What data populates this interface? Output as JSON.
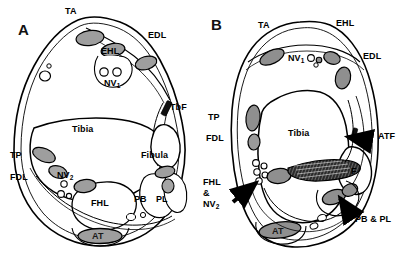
{
  "figure": {
    "type": "anatomical-cross-section-diagram",
    "panels": [
      {
        "id": "A",
        "letter": "A",
        "level": "distal tibia",
        "labels": [
          {
            "key": "ta",
            "text": "TA",
            "meaning": "tibialis anterior"
          },
          {
            "key": "ehl",
            "text": "EHL",
            "meaning": "extensor hallucis longus"
          },
          {
            "key": "edl",
            "text": "EDL",
            "meaning": "extensor digitorum longus"
          },
          {
            "key": "nv1",
            "text": "NV",
            "sub": "1",
            "meaning": "anterior neurovascular bundle"
          },
          {
            "key": "tbf",
            "text": "TbF",
            "meaning": "tibiofibular ligament"
          },
          {
            "key": "tibia",
            "text": "Tibia",
            "meaning": "tibia"
          },
          {
            "key": "fibula",
            "text": "Fibula",
            "meaning": "fibula"
          },
          {
            "key": "tp",
            "text": "TP",
            "meaning": "tibialis posterior"
          },
          {
            "key": "fdl",
            "text": "FDL",
            "meaning": "flexor digitorum longus"
          },
          {
            "key": "nv2",
            "text": "NV",
            "sub": "2",
            "meaning": "posterior neurovascular bundle"
          },
          {
            "key": "fhl",
            "text": "FHL",
            "meaning": "flexor hallucis longus"
          },
          {
            "key": "pb",
            "text": "PB",
            "meaning": "peroneus brevis"
          },
          {
            "key": "pl",
            "text": "PL",
            "meaning": "peroneus longus"
          },
          {
            "key": "at",
            "text": "AT",
            "meaning": "Achilles tendon"
          }
        ]
      },
      {
        "id": "B",
        "letter": "B",
        "level": "ankle joint",
        "labels": [
          {
            "key": "ta",
            "text": "TA",
            "meaning": "tibialis anterior"
          },
          {
            "key": "ehl",
            "text": "EHL",
            "meaning": "extensor hallucis longus"
          },
          {
            "key": "edl",
            "text": "EDL",
            "meaning": "extensor digitorum longus"
          },
          {
            "key": "nv1",
            "text": "NV",
            "sub": "1",
            "meaning": "anterior neurovascular bundle"
          },
          {
            "key": "tp",
            "text": "TP",
            "meaning": "tibialis posterior"
          },
          {
            "key": "fdl",
            "text": "FDL",
            "meaning": "flexor digitorum longus"
          },
          {
            "key": "tibia",
            "text": "Tibia",
            "meaning": "tibia"
          },
          {
            "key": "atf",
            "text": "ATF",
            "meaning": "anterior talofibular ligament"
          },
          {
            "key": "f",
            "text": "F",
            "meaning": "fibula"
          },
          {
            "key": "fhlnv2",
            "text": "FHL\n&\nNV",
            "lines": [
              "FHL",
              "&",
              "NV"
            ],
            "sub": "2",
            "meaning": "flexor hallucis longus and posterior neurovascular bundle"
          },
          {
            "key": "pbpl",
            "text": "PB & PL",
            "meaning": "peroneus brevis and peroneus longus"
          },
          {
            "key": "at",
            "text": "AT",
            "meaning": "Achilles tendon"
          }
        ]
      }
    ],
    "colors": {
      "outline": "#000000",
      "fill_white": "#ffffff",
      "tendon_gray": "#9a9a9a",
      "tendon_gray_light": "#b4b4b4",
      "ligament_black": "#111111",
      "background": "#ffffff"
    }
  }
}
